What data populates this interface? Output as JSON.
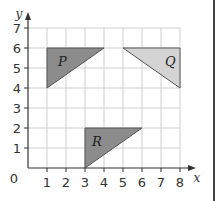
{
  "axes": {
    "x_label": "x",
    "y_label": "y",
    "origin_label": "0",
    "x_ticks": [
      "1",
      "2",
      "3",
      "4",
      "5",
      "6",
      "7",
      "8"
    ],
    "y_ticks": [
      "1",
      "2",
      "3",
      "4",
      "5",
      "6",
      "7"
    ]
  },
  "shapes": [
    {
      "label": "P",
      "vertices": [
        [
          1,
          4
        ],
        [
          1,
          6
        ],
        [
          4,
          6
        ]
      ],
      "fill": "#8c8c8c"
    },
    {
      "label": "Q",
      "vertices": [
        [
          5,
          6
        ],
        [
          8,
          6
        ],
        [
          8,
          4
        ]
      ],
      "fill": "#d4d4d4"
    },
    {
      "label": "R",
      "vertices": [
        [
          3,
          0
        ],
        [
          3,
          2
        ],
        [
          6,
          2
        ]
      ],
      "fill": "#8c8c8c"
    }
  ],
  "colors": {
    "grid": "#cfcfcf",
    "axis": "#333333",
    "border": "#444444"
  }
}
